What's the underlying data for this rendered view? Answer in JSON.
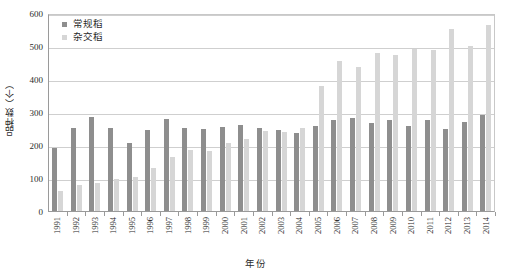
{
  "chart_data": {
    "type": "bar",
    "title": "",
    "xlabel": "年份",
    "ylabel": "品种数（个）",
    "ylim": [
      0,
      600
    ],
    "yticks": [
      0,
      100,
      200,
      300,
      400,
      500,
      600
    ],
    "grid": true,
    "legend_position": "top-left",
    "categories": [
      "1991",
      "1992",
      "1993",
      "1994",
      "1995",
      "1996",
      "1997",
      "1998",
      "1999",
      "2000",
      "2001",
      "2002",
      "2003",
      "2004",
      "2005",
      "2006",
      "2007",
      "2008",
      "2009",
      "2010",
      "2011",
      "2012",
      "2013",
      "2014"
    ],
    "series": [
      {
        "name": "常规稻",
        "color": "#8e8e8e",
        "values": [
          190,
          252,
          285,
          252,
          205,
          245,
          280,
          252,
          250,
          255,
          260,
          252,
          245,
          237,
          258,
          275,
          282,
          268,
          277,
          258,
          277,
          250,
          270,
          292
        ]
      },
      {
        "name": "杂交稻",
        "color": "#d6d6d6",
        "values": [
          60,
          78,
          85,
          97,
          103,
          130,
          165,
          185,
          182,
          205,
          218,
          243,
          238,
          252,
          378,
          455,
          437,
          480,
          472,
          492,
          487,
          552,
          500,
          565
        ]
      }
    ]
  },
  "axes": {
    "y_tick_labels": [
      "600",
      "500",
      "400",
      "300",
      "200",
      "100",
      "0"
    ],
    "x_tick_labels": [
      "1991",
      "1992",
      "1993",
      "1994",
      "1995",
      "1996",
      "1997",
      "1998",
      "1999",
      "2000",
      "2001",
      "2002",
      "2003",
      "2004",
      "2005",
      "2006",
      "2007",
      "2008",
      "2009",
      "2010",
      "2011",
      "2012",
      "2013",
      "2014"
    ],
    "y_axis_title": "品种数（个）",
    "x_axis_title": "年份"
  },
  "legend": {
    "items": [
      {
        "label": "常规稻",
        "color": "#8e8e8e"
      },
      {
        "label": "杂交稻",
        "color": "#d6d6d6"
      }
    ]
  },
  "colors": {
    "conventional": "#8e8e8e",
    "hybrid": "#d6d6d6",
    "gridline": "#cfcfcf",
    "axis": "#9a9a9a",
    "text": "#2b2b2b",
    "background": "#ffffff"
  }
}
